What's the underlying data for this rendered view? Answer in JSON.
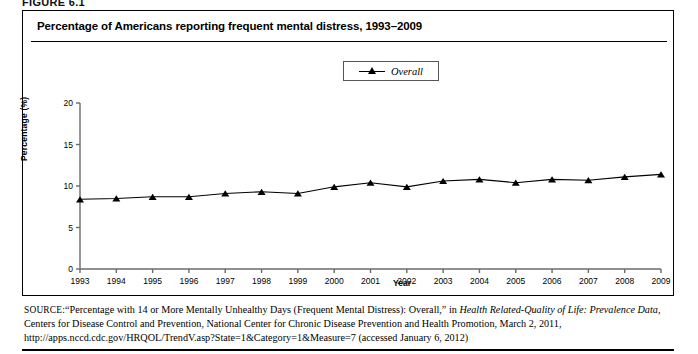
{
  "figure": {
    "label": "FIGURE 6.1",
    "title": "Percentage of Americans reporting frequent mental distress, 1993–2009"
  },
  "legend": {
    "position": "top-center",
    "entries": [
      {
        "label": "Overall",
        "marker": "triangle-up",
        "color": "#000000"
      }
    ]
  },
  "axes": {
    "ylabel": "Percentage (%)",
    "xlabel": "Year",
    "yticks": [
      "0",
      "5",
      "10",
      "15",
      "20"
    ],
    "xticks": [
      "1993",
      "1994",
      "1995",
      "1996",
      "1997",
      "1998",
      "1999",
      "2000",
      "2001",
      "2002",
      "2003",
      "2004",
      "2005",
      "2006",
      "2007",
      "2008",
      "2009"
    ]
  },
  "source": {
    "prefix": "SOURCE:",
    "text_1": "“Percentage with 14 or More Mentally Unhealthy Days (Frequent Mental Distress): Overall,” in ",
    "italic_1": "Health Related-Quality of Life: Prevalence Data,",
    "text_2": " Centers for Disease Control and Prevention, National Center for Chronic Disease Prevention and Health Promotion, March 2, 2011, http://apps.nccd.cdc.gov/HRQOL/TrendV.asp?State=1&Category=1&Measure=7 (accessed January 6, 2012)"
  },
  "chart_data": {
    "type": "line",
    "title": "Percentage of Americans reporting frequent mental distress, 1993–2009",
    "xlabel": "Year",
    "ylabel": "Percentage (%)",
    "xlim": [
      1993,
      2009
    ],
    "ylim": [
      0,
      20
    ],
    "ytick_values": [
      0,
      5,
      10,
      15,
      20
    ],
    "grid": false,
    "legend_position": "top-center",
    "categories": [
      1993,
      1994,
      1995,
      1996,
      1997,
      1998,
      1999,
      2000,
      2001,
      2002,
      2003,
      2004,
      2005,
      2006,
      2007,
      2008,
      2009
    ],
    "series": [
      {
        "name": "Overall",
        "marker": "triangle-up",
        "color": "#000000",
        "values": [
          8.4,
          8.5,
          8.7,
          8.7,
          9.1,
          9.3,
          9.1,
          9.9,
          10.4,
          9.9,
          10.6,
          10.8,
          10.4,
          10.8,
          10.7,
          11.1,
          11.4
        ]
      }
    ]
  }
}
